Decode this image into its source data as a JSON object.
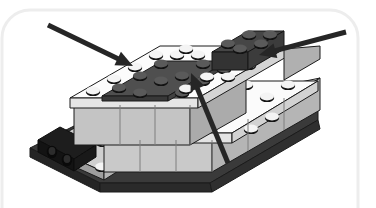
{
  "figure": {
    "canvas": {
      "width": 376,
      "height": 208,
      "background": "#ffffff"
    },
    "frame": {
      "name": "page-border-frame",
      "shape": "rounded-rectangle",
      "stroke": "#ededed",
      "stroke_width": 3,
      "x": 2,
      "y": 10,
      "width": 356,
      "height": 230,
      "corner_radius": 28
    }
  },
  "palette": {
    "white_top": "#fdfdfd",
    "white_shade": "#e9e9e9",
    "light_gray_top": "#d9d9d9",
    "light_gray_front": "#c2c2c2",
    "light_gray_side": "#a8a8a8",
    "mid_gray": "#8f8f8f",
    "dark_gray_top": "#4a4a4a",
    "dark_gray_front": "#3a3a3a",
    "dark_gray_side": "#2e2e2e",
    "black": "#1a1a1a",
    "stud_top": "#f2f2f2",
    "stud_ring": "#141414",
    "stud_dark_top": "#555555",
    "outline": "#1b1b1b",
    "arrow": "#262626"
  },
  "model": {
    "name": "lego-brick-assembly",
    "description": "Isometric view of a partially built LEGO chassis: dark baseplate, light gray brick walls, white top plates, a dark gray inset plate and a dark gray end brick.",
    "parts": [
      {
        "id": "baseplate",
        "label": "dark baseplate",
        "color": "#2e2e2e",
        "studs": 6
      },
      {
        "id": "technic-brick",
        "label": "black technic brick with holes",
        "color": "#1a1a1a",
        "holes": 2
      },
      {
        "id": "left-step-plate",
        "label": "light gray step plate",
        "color": "#c2c2c2"
      },
      {
        "id": "long-wall-front",
        "label": "light gray long wall front",
        "color": "#c2c2c2"
      },
      {
        "id": "long-wall-top",
        "label": "white top plate row",
        "color": "#fdfdfd"
      },
      {
        "id": "inset-plate",
        "label": "dark gray inset plate",
        "color": "#4a4a4a",
        "studs": 12
      },
      {
        "id": "end-brick",
        "label": "dark gray end brick",
        "color": "#3a3a3a",
        "studs": 6
      }
    ]
  },
  "annotations": {
    "name": "callout-arrows",
    "count": 3,
    "items": [
      {
        "id": "arrow-top-left",
        "label": "arrow pointing to white top plate",
        "direction": "down-right",
        "tail": {
          "x": 48,
          "y": 25
        },
        "head": {
          "x": 133,
          "y": 66
        },
        "color": "#262626",
        "line_width": 5
      },
      {
        "id": "arrow-right",
        "label": "arrow pointing to dark gray end brick",
        "direction": "left",
        "tail": {
          "x": 346,
          "y": 32
        },
        "head": {
          "x": 259,
          "y": 55
        },
        "color": "#262626",
        "line_width": 5
      },
      {
        "id": "arrow-bottom-center",
        "label": "arrow pointing to dark gray inset plate",
        "direction": "up-left",
        "tail": {
          "x": 228,
          "y": 163
        },
        "head": {
          "x": 191,
          "y": 73
        },
        "color": "#262626",
        "line_width": 5
      }
    ]
  }
}
